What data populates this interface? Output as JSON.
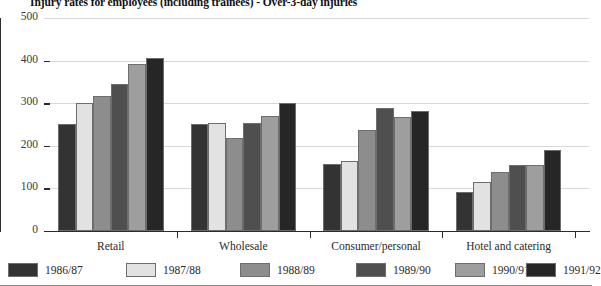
{
  "chart_data": {
    "type": "bar",
    "title": "Injury rates for employees (including trainees) - Over-3-day injuries",
    "xlabel": "",
    "ylabel": "",
    "ylim": [
      0,
      500
    ],
    "yticks": [
      0,
      100,
      200,
      300,
      400,
      500
    ],
    "grid": true,
    "legend_position": "bottom",
    "categories": [
      "Retail",
      "Wholesale",
      "Consumer/personal",
      "Hotel and catering"
    ],
    "series": [
      {
        "name": "1986/87",
        "color": "#333333",
        "values": [
          252,
          251,
          157,
          92
        ]
      },
      {
        "name": "1987/88",
        "color": "#e2e2e2",
        "values": [
          300,
          254,
          165,
          116
        ]
      },
      {
        "name": "1988/89",
        "color": "#8d8d8d",
        "values": [
          317,
          218,
          237,
          139
        ]
      },
      {
        "name": "1989/90",
        "color": "#4f4f4f",
        "values": [
          345,
          253,
          288,
          155
        ]
      },
      {
        "name": "1990/91",
        "color": "#9e9e9e",
        "values": [
          392,
          269,
          268,
          154
        ]
      },
      {
        "name": "1991/92",
        "color": "#262626",
        "values": [
          406,
          301,
          281,
          190
        ]
      }
    ]
  },
  "axis": {
    "y_tick_labels": [
      "500",
      "400",
      "300",
      "200",
      "100",
      "0"
    ]
  },
  "legend": {
    "items": [
      {
        "label": "1986/87",
        "color": "#333333"
      },
      {
        "label": "1987/88",
        "color": "#e2e2e2"
      },
      {
        "label": "1988/89",
        "color": "#8d8d8d"
      },
      {
        "label": "1989/90",
        "color": "#4f4f4f"
      },
      {
        "label": "1990/91",
        "color": "#9e9e9e"
      },
      {
        "label": "1991/92",
        "color": "#262626"
      }
    ]
  }
}
